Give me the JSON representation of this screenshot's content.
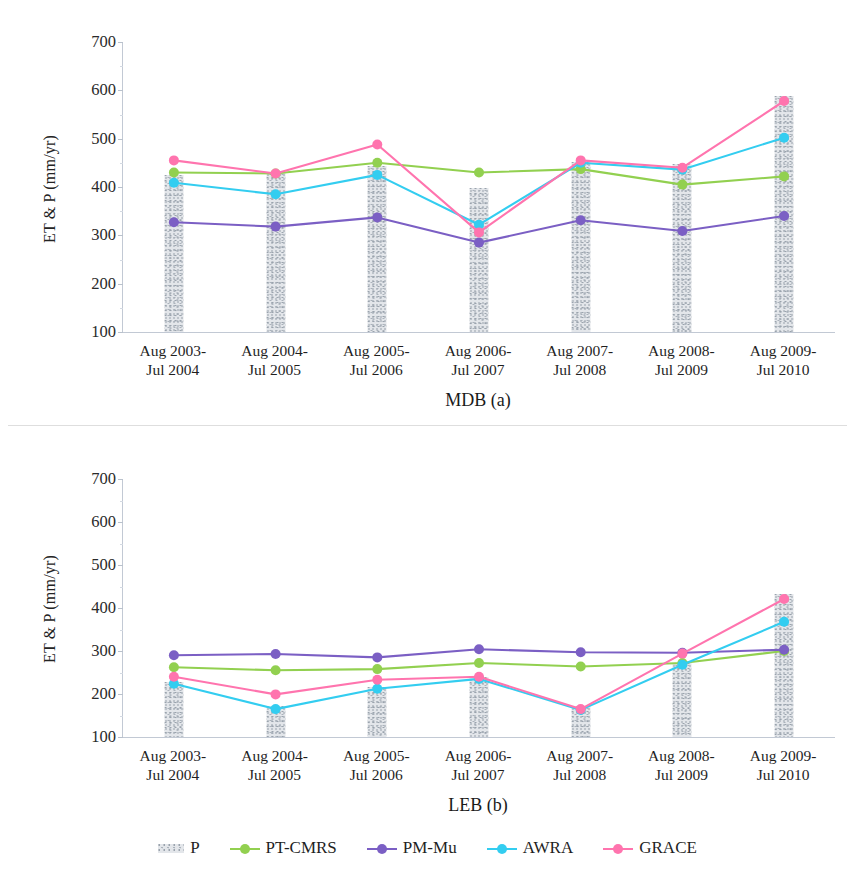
{
  "figure": {
    "ylabel": "ET & P (mm/yr)",
    "legend": [
      {
        "name": "P",
        "type": "bar",
        "color": "#d8dce1"
      },
      {
        "name": "PT-CMRS",
        "type": "line",
        "color": "#92d050"
      },
      {
        "name": "PM-Mu",
        "type": "line",
        "color": "#7b5fc4"
      },
      {
        "name": "AWRA",
        "type": "line",
        "color": "#33cdf0"
      },
      {
        "name": "GRACE",
        "type": "line",
        "color": "#ff74ae"
      }
    ]
  },
  "chart_data": [
    {
      "type": "line",
      "title": "MDB (a)",
      "xlabel": "MDB (a)",
      "ylabel": "ET & P (mm/yr)",
      "ylim": [
        100,
        700
      ],
      "yticks": [
        100,
        200,
        300,
        400,
        500,
        600,
        700
      ],
      "grid": false,
      "legend_position": "bottom",
      "categories": [
        "Aug 2003-\nJul 2004",
        "Aug 2004-\nJul 2005",
        "Aug 2005-\nJul 2006",
        "Aug 2006-\nJul 2007",
        "Aug 2007-\nJul 2008",
        "Aug 2008-\nJul 2009",
        "Aug 2009-\nJul 2010"
      ],
      "series": [
        {
          "name": "P",
          "type": "bar",
          "color": "#d8dce1",
          "values": [
            424,
            432,
            443,
            398,
            452,
            448,
            588
          ]
        },
        {
          "name": "PT-CMRS",
          "type": "line",
          "color": "#92d050",
          "values": [
            430,
            428,
            450,
            430,
            437,
            405,
            422
          ]
        },
        {
          "name": "PM-Mu",
          "type": "line",
          "color": "#7b5fc4",
          "values": [
            327,
            318,
            337,
            285,
            331,
            309,
            340
          ]
        },
        {
          "name": "AWRA",
          "type": "line",
          "color": "#33cdf0",
          "values": [
            409,
            385,
            425,
            322,
            450,
            436,
            502
          ]
        },
        {
          "name": "GRACE",
          "type": "line",
          "color": "#ff74ae",
          "values": [
            455,
            428,
            488,
            306,
            455,
            440,
            578
          ]
        }
      ]
    },
    {
      "type": "line",
      "title": "LEB (b)",
      "xlabel": "LEB (b)",
      "ylabel": "ET & P (mm/yr)",
      "ylim": [
        100,
        700
      ],
      "yticks": [
        100,
        200,
        300,
        400,
        500,
        600,
        700
      ],
      "grid": false,
      "legend_position": "bottom",
      "categories": [
        "Aug 2003-\nJul 2004",
        "Aug 2004-\nJul 2005",
        "Aug 2005-\nJul 2006",
        "Aug 2006-\nJul 2007",
        "Aug 2007-\nJul 2008",
        "Aug 2008-\nJul 2009",
        "Aug 2009-\nJul 2010"
      ],
      "series": [
        {
          "name": "P",
          "type": "bar",
          "color": "#d8dce1",
          "values": [
            228,
            172,
            216,
            240,
            172,
            272,
            432
          ]
        },
        {
          "name": "PT-CMRS",
          "type": "line",
          "color": "#92d050",
          "values": [
            262,
            255,
            258,
            272,
            264,
            272,
            300
          ]
        },
        {
          "name": "PM-Mu",
          "type": "line",
          "color": "#7b5fc4",
          "values": [
            290,
            293,
            285,
            304,
            297,
            296,
            303
          ]
        },
        {
          "name": "AWRA",
          "type": "line",
          "color": "#33cdf0",
          "values": [
            224,
            165,
            212,
            235,
            163,
            268,
            368
          ]
        },
        {
          "name": "GRACE",
          "type": "line",
          "color": "#ff74ae",
          "values": [
            240,
            199,
            233,
            240,
            165,
            294,
            421
          ]
        }
      ]
    }
  ]
}
